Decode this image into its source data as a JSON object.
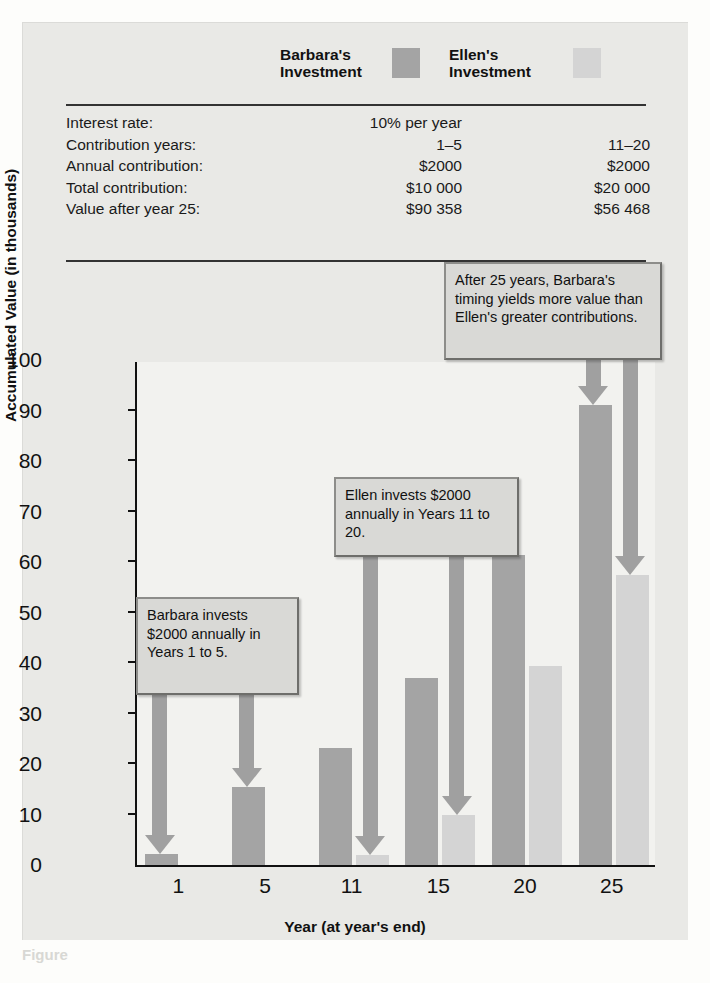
{
  "figure": {
    "caption": "Figure"
  },
  "legend": {
    "barbara_label": "Barbara's\nInvestment",
    "ellen_label": "Ellen's\nInvestment",
    "barbara_color": "#a4a4a4",
    "ellen_color": "#d4d4d4"
  },
  "table": {
    "rows": [
      {
        "label": "Interest rate:",
        "barbara": "10% per year",
        "ellen": ""
      },
      {
        "label": "Contribution years:",
        "barbara": "1–5",
        "ellen": "11–20"
      },
      {
        "label": "Annual contribution:",
        "barbara": "$2000",
        "ellen": "$2000"
      },
      {
        "label": "Total contribution:",
        "barbara": "$10 000",
        "ellen": "$20 000"
      },
      {
        "label": "Value after year 25:",
        "barbara": "$90 358",
        "ellen": "$56 468"
      }
    ]
  },
  "callouts": [
    {
      "id": "barbara",
      "text": "Barbara invests $2000 annually in Years 1 to 5."
    },
    {
      "id": "ellen",
      "text": "Ellen invests $2000 annually in Years 11 to 20."
    },
    {
      "id": "summary",
      "text": "After 25 years, Barbara's timing yields more value than Ellen's greater contributions."
    }
  ],
  "chart_data": {
    "type": "bar",
    "title": "",
    "xlabel": "Year (at year's end)",
    "ylabel": "Accumulated Value (in thousands)",
    "categories": [
      "1",
      "5",
      "11",
      "15",
      "20",
      "25"
    ],
    "ylim": [
      0,
      100
    ],
    "yticks": [
      0,
      10,
      20,
      30,
      40,
      50,
      60,
      70,
      80,
      90,
      100
    ],
    "grid": false,
    "legend_position": "top",
    "series": [
      {
        "name": "Barbara's Investment",
        "color": "#a4a4a4",
        "values": [
          2.2,
          15.5,
          23.2,
          37.1,
          61.4,
          91.0
        ]
      },
      {
        "name": "Ellen's Investment",
        "color": "#d4d4d4",
        "values": [
          0,
          0,
          2.0,
          9.9,
          39.4,
          57.5
        ]
      }
    ]
  }
}
